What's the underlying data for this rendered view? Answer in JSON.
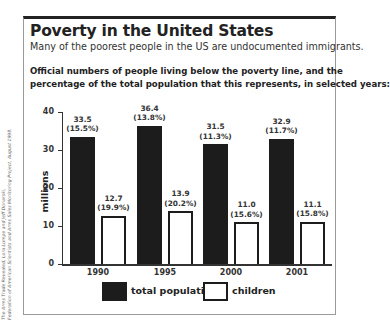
{
  "header": {
    "title": "Poverty in the United States",
    "subtitle": "Many of the poorest people in the US are undocumented immigrants.",
    "intro_line1": "Official numbers of people living below the poverty line, and the",
    "intro_line2": "percentage of the total population that this represents, in selected years:"
  },
  "source": {
    "line1": "The Arms Trade Revealed, Lora Lumpe and Jeff Donarski,",
    "line2": "Federation of American Scientists and Arms Sales Monitoring Project, August 1998."
  },
  "axis": {
    "ylabel": "millions",
    "ticks": [
      "0",
      "10",
      "20",
      "30",
      "40"
    ]
  },
  "legend": {
    "total": "total population",
    "children": "children"
  },
  "colors": {
    "total": "#1c1c1c",
    "children": "#ffffff"
  },
  "chart_data": {
    "type": "bar",
    "title": "Poverty in the United States",
    "subtitle": "Many of the poorest people in the US are undocumented immigrants.",
    "xlabel": "",
    "ylabel": "millions",
    "ylim": [
      0,
      40
    ],
    "yticks": [
      0,
      10,
      20,
      30,
      40
    ],
    "grid": false,
    "legend_position": "bottom",
    "categories": [
      "1990",
      "1995",
      "2000",
      "2001"
    ],
    "series": [
      {
        "name": "total population",
        "values": [
          33.5,
          36.4,
          31.5,
          32.9
        ],
        "percent_labels": [
          "(15.5%)",
          "(13.8%)",
          "(11.3%)",
          "(11.7%)"
        ],
        "value_labels": [
          "33.5",
          "36.4",
          "31.5",
          "32.9"
        ]
      },
      {
        "name": "children",
        "values": [
          12.7,
          13.9,
          11.0,
          11.1
        ],
        "percent_labels": [
          "(19.9%)",
          "(20.2%)",
          "(15.6%)",
          "(15.8%)"
        ],
        "value_labels": [
          "12.7",
          "13.9",
          "11.0",
          "11.1"
        ]
      }
    ]
  }
}
